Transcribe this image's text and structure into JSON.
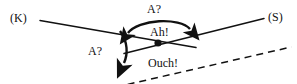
{
  "figure": {
    "background_color": "#ffffff",
    "stroke_color": "#111111",
    "width": 297,
    "height": 84
  },
  "labels": {
    "endpoint_left": "(K)",
    "endpoint_right": "(S)",
    "arc_top": "A?",
    "arc_top_inner": "Ah!",
    "arc_left": "A?",
    "arc_bottom_inner": "Ouch!"
  },
  "elements": {
    "line_k": {
      "name": "solid-line-k",
      "style": "solid",
      "from": [
        40,
        20
      ],
      "to": [
        196,
        47
      ]
    },
    "line_s": {
      "name": "solid-line-s",
      "style": "solid",
      "from": [
        124,
        53
      ],
      "to": [
        264,
        18
      ]
    },
    "line_dashed": {
      "name": "dashed-line",
      "style": "dashed",
      "from": [
        36,
        79
      ],
      "to": [
        288,
        74
      ]
    },
    "intersection_dot": {
      "name": "intersection-dot",
      "position": [
        158,
        43
      ],
      "radius": 3.6
    },
    "arrow_top": {
      "name": "double-headed-arc-arrow",
      "heads": 2,
      "direction": "bidirectional"
    },
    "arrow_down": {
      "name": "curved-down-arrow",
      "heads": 1,
      "direction": "downward"
    }
  }
}
